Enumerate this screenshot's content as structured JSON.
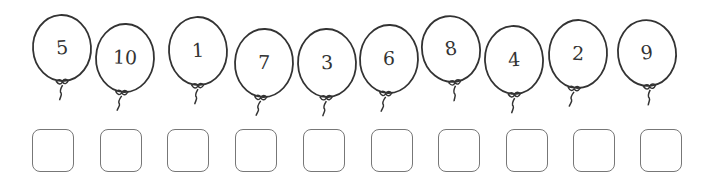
{
  "worksheet": {
    "balloons": [
      {
        "number": "5",
        "cx": 62,
        "cy": 48,
        "rx": 29,
        "ry": 33,
        "tilt": -4
      },
      {
        "number": "10",
        "cx": 125,
        "cy": 58,
        "rx": 29,
        "ry": 34,
        "tilt": 2
      },
      {
        "number": "1",
        "cx": 198,
        "cy": 51,
        "rx": 29,
        "ry": 34,
        "tilt": -3
      },
      {
        "number": "7",
        "cx": 264,
        "cy": 63,
        "rx": 29,
        "ry": 34,
        "tilt": 2
      },
      {
        "number": "3",
        "cx": 327,
        "cy": 63,
        "rx": 29,
        "ry": 34,
        "tilt": -2
      },
      {
        "number": "6",
        "cx": 389,
        "cy": 59,
        "rx": 29,
        "ry": 34,
        "tilt": 2
      },
      {
        "number": "8",
        "cx": 451,
        "cy": 49,
        "rx": 29,
        "ry": 33,
        "tilt": -10
      },
      {
        "number": "4",
        "cx": 514,
        "cy": 60,
        "rx": 29,
        "ry": 34,
        "tilt": -4
      },
      {
        "number": "2",
        "cx": 578,
        "cy": 54,
        "rx": 29,
        "ry": 34,
        "tilt": 3
      },
      {
        "number": "9",
        "cx": 647,
        "cy": 53,
        "rx": 29,
        "ry": 33,
        "tilt": -8
      }
    ],
    "answer_boxes": [
      {
        "x": 32,
        "y": 129,
        "value": ""
      },
      {
        "x": 100,
        "y": 129,
        "value": ""
      },
      {
        "x": 167,
        "y": 129,
        "value": ""
      },
      {
        "x": 235,
        "y": 129,
        "value": ""
      },
      {
        "x": 303,
        "y": 129,
        "value": ""
      },
      {
        "x": 371,
        "y": 129,
        "value": ""
      },
      {
        "x": 438,
        "y": 129,
        "value": ""
      },
      {
        "x": 506,
        "y": 129,
        "value": ""
      },
      {
        "x": 573,
        "y": 129,
        "value": ""
      },
      {
        "x": 640,
        "y": 129,
        "value": ""
      }
    ],
    "colors": {
      "stroke": "#333333",
      "box_border": "#777777",
      "background": "#ffffff"
    }
  }
}
